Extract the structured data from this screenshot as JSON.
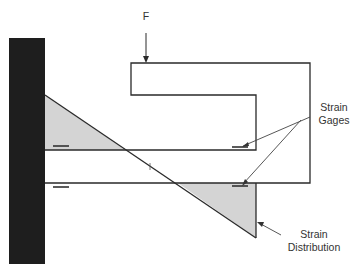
{
  "diagram": {
    "force_label": "F",
    "strain_gages_label_line1": "Strain",
    "strain_gages_label_line2": "Gages",
    "strain_distribution_label_line1": "Strain",
    "strain_distribution_label_line2": "Distribution",
    "colors": {
      "wall": "#1e1e1e",
      "line": "#2a2a2a",
      "shade": "#d4d4d4",
      "text": "#333333"
    }
  }
}
